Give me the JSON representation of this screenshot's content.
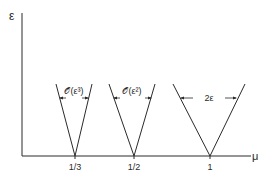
{
  "axes": {
    "y_label": "ε",
    "x_label": "μ"
  },
  "ticks": [
    {
      "label": "1/3",
      "x": 75
    },
    {
      "label": "1/2",
      "x": 134
    },
    {
      "label": "1",
      "x": 210
    }
  ],
  "tongues": [
    {
      "vertex": "1/3",
      "width_label": "𝒪(ε³)"
    },
    {
      "vertex": "1/2",
      "width_label": "𝒪(ε²)"
    },
    {
      "vertex": "1",
      "width_label": "2ε"
    }
  ],
  "colors": {
    "line": "#2a2a2a",
    "background": "#ffffff"
  }
}
